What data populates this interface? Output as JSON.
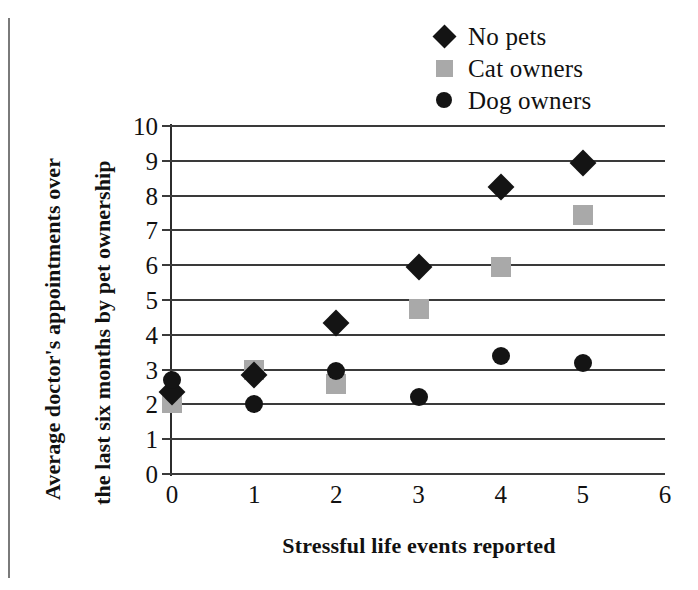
{
  "chart_data": {
    "type": "scatter",
    "title": "",
    "xlabel": "Stressful life events reported",
    "ylabel": "Average doctor's appointments over the last six months by pet ownership",
    "ylabel_line1": "Average doctor's appointments over",
    "ylabel_line2": "the last six months by pet ownership",
    "x": [
      0,
      1,
      2,
      3,
      4,
      5
    ],
    "xlim": [
      0,
      6
    ],
    "ylim": [
      0,
      10
    ],
    "xticks": [
      "0",
      "1",
      "2",
      "3",
      "4",
      "5",
      "6"
    ],
    "yticks": [
      "0",
      "1",
      "2",
      "3",
      "4",
      "5",
      "6",
      "7",
      "8",
      "9",
      "10"
    ],
    "grid": "horizontal",
    "legend_position": "top-right",
    "series": [
      {
        "name": "No pets",
        "marker": "diamond",
        "color": "#141414",
        "values": [
          2.35,
          2.85,
          4.35,
          5.95,
          8.25,
          8.95
        ]
      },
      {
        "name": "Cat owners",
        "marker": "square",
        "color": "#a9a9a9",
        "values": [
          2.05,
          3.0,
          2.6,
          4.75,
          5.95,
          7.45
        ]
      },
      {
        "name": "Dog owners",
        "marker": "circle",
        "color": "#141414",
        "values": [
          2.7,
          2.0,
          2.95,
          2.2,
          3.4,
          3.2
        ]
      }
    ]
  },
  "legend": {
    "items": [
      {
        "label": "No pets",
        "marker": "diamond-marker"
      },
      {
        "label": "Cat owners",
        "marker": "square-marker"
      },
      {
        "label": "Dog owners",
        "marker": "circle-marker"
      }
    ]
  }
}
